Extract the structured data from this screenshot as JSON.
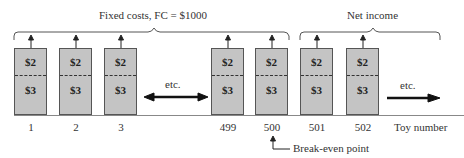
{
  "brackets": {
    "fixed_costs_label": "Fixed costs, FC = $1000",
    "net_income_label": "Net income"
  },
  "boxes": [
    {
      "toy": "1",
      "top_value": "$2",
      "bottom_value": "$3"
    },
    {
      "toy": "2",
      "top_value": "$2",
      "bottom_value": "$3"
    },
    {
      "toy": "3",
      "top_value": "$2",
      "bottom_value": "$3"
    },
    {
      "toy": "499",
      "top_value": "$2",
      "bottom_value": "$3"
    },
    {
      "toy": "500",
      "top_value": "$2",
      "bottom_value": "$3"
    },
    {
      "toy": "501",
      "top_value": "$2",
      "bottom_value": "$3"
    },
    {
      "toy": "502",
      "top_value": "$2",
      "bottom_value": "$3"
    }
  ],
  "etc_left": "etc.",
  "etc_right": "etc.",
  "axis_label": "Toy number",
  "break_even_label": "Break-even point",
  "colors": {
    "box_fill": "#c4c4c4",
    "box_border": "#555555"
  }
}
